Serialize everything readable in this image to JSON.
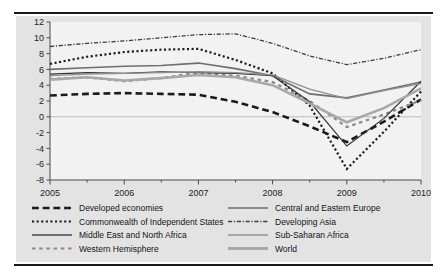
{
  "chart_data": {
    "type": "line",
    "title": "",
    "xlabel": "",
    "ylabel": "",
    "xlim": [
      2005.0,
      2010.0
    ],
    "ylim": [
      -8,
      12
    ],
    "yticks": [
      12,
      10,
      8,
      6,
      4,
      2,
      0,
      -2,
      -4,
      -6,
      -8
    ],
    "xticks": [
      2005,
      2006,
      2007,
      2008,
      2009,
      2010
    ],
    "xtick_labels": [
      "2005",
      "2006",
      "2007",
      "2008",
      "2009",
      "2010"
    ],
    "grid": false,
    "zero_line": true,
    "legend_position": "bottom",
    "legend_columns": 2,
    "x": [
      2005.0,
      2005.5,
      2006.0,
      2006.5,
      2007.0,
      2007.5,
      2008.0,
      2008.5,
      2009.0,
      2009.5,
      2010.0
    ],
    "series": [
      {
        "name": "Developed economies",
        "style": "long-dash",
        "color": "#1a1a1a",
        "width": 2.6,
        "values": [
          2.7,
          2.9,
          3.0,
          2.9,
          2.8,
          1.9,
          0.6,
          -1.2,
          -3.2,
          -0.6,
          2.2
        ]
      },
      {
        "name": "Commonwealth of Independent States",
        "style": "dotted",
        "color": "#1a1a1a",
        "width": 2.2,
        "values": [
          6.7,
          7.6,
          8.2,
          8.5,
          8.6,
          7.2,
          5.5,
          1.4,
          -6.6,
          -1.9,
          3.2
        ]
      },
      {
        "name": "Middle East and North Africa",
        "style": "solid",
        "color": "#6e6e6e",
        "width": 1.6,
        "values": [
          6.0,
          6.2,
          6.4,
          6.5,
          6.8,
          6.1,
          5.2,
          2.9,
          2.4,
          3.4,
          4.4
        ]
      },
      {
        "name": "Western Hemisphere",
        "style": "dashed",
        "color": "#8a8a8a",
        "width": 2.2,
        "values": [
          4.8,
          5.0,
          4.5,
          4.9,
          5.6,
          5.2,
          4.4,
          2.0,
          -1.3,
          0.3,
          2.1
        ]
      },
      {
        "name": "Central and Eastern Europe",
        "style": "solid",
        "color": "#333333",
        "width": 1.2,
        "values": [
          5.4,
          5.6,
          5.5,
          5.7,
          5.6,
          5.5,
          5.2,
          1.9,
          -3.7,
          -0.2,
          4.5
        ]
      },
      {
        "name": "Developing Asia",
        "style": "dash-dot",
        "color": "#3d3d3d",
        "width": 1.3,
        "values": [
          8.9,
          9.3,
          9.6,
          10.0,
          10.4,
          10.5,
          9.3,
          7.7,
          6.6,
          7.4,
          8.5
        ]
      },
      {
        "name": "Sub-Saharan Africa",
        "style": "solid",
        "color": "#909090",
        "width": 1.3,
        "values": [
          5.2,
          5.4,
          5.5,
          5.6,
          5.7,
          5.6,
          5.3,
          3.5,
          2.3,
          3.3,
          4.2
        ]
      },
      {
        "name": "World",
        "style": "solid",
        "color": "#a8a8a8",
        "width": 2.6,
        "values": [
          4.7,
          5.0,
          4.6,
          4.9,
          5.3,
          5.0,
          4.0,
          1.7,
          -0.7,
          1.1,
          3.6
        ]
      }
    ]
  },
  "legend": {
    "left_column": [
      {
        "label": "Developed economies",
        "style": "long-dash",
        "color": "#1a1a1a",
        "width": 2.6
      },
      {
        "label": "Commonwealth of Independent States",
        "style": "dotted",
        "color": "#1a1a1a",
        "width": 2.2
      },
      {
        "label": "Middle East and North Africa",
        "style": "solid",
        "color": "#6e6e6e",
        "width": 1.8
      },
      {
        "label": "Western Hemisphere",
        "style": "dashed",
        "color": "#8a8a8a",
        "width": 2.2
      }
    ],
    "right_column": [
      {
        "label": "Central and Eastern Europe",
        "style": "solid",
        "color": "#333333",
        "width": 1.2
      },
      {
        "label": "Developing Asia",
        "style": "dash-dot",
        "color": "#3d3d3d",
        "width": 1.3
      },
      {
        "label": "Sub-Saharan Africa",
        "style": "solid",
        "color": "#909090",
        "width": 1.4
      },
      {
        "label": "World",
        "style": "solid",
        "color": "#a8a8a8",
        "width": 2.8
      }
    ]
  },
  "colors": {
    "panel_background": "#e3e3e3",
    "plot_background": "#f2f2f2",
    "axis": "#4a4a4a",
    "rule": "#1a1a1a",
    "zero_line": "#bdbdbd"
  }
}
